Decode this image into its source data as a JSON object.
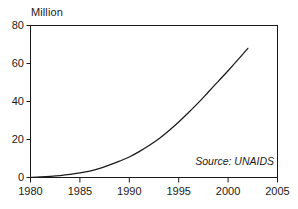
{
  "chart_data": {
    "type": "line",
    "title": "",
    "subtitle": "",
    "unit_label": "Million",
    "xlabel": "",
    "ylabel": "",
    "xlim": [
      1980,
      2005
    ],
    "ylim": [
      0,
      80
    ],
    "grid": false,
    "legend": "none",
    "line_color": "#1a1a1a",
    "background_color": "#ffffff",
    "axis_color": "#1a1a1a",
    "annotations": [
      {
        "name": "source-note",
        "text": "Source: UNAIDS",
        "style": "italic",
        "position": "inside-bottom-right"
      }
    ],
    "xticks": [
      1980,
      1985,
      1990,
      1995,
      2000,
      2005
    ],
    "xtick_labels": [
      "1980",
      "1985",
      "1990",
      "1995",
      "2000",
      "2005"
    ],
    "yticks": [
      0,
      20,
      40,
      60,
      80
    ],
    "ytick_labels": [
      "0",
      "20",
      "40",
      "60",
      "80"
    ],
    "series": [
      {
        "name": "Cumulative infections",
        "x": [
          1980,
          1981,
          1982,
          1983,
          1984,
          1985,
          1986,
          1987,
          1988,
          1989,
          1990,
          1991,
          1992,
          1993,
          1994,
          1995,
          1996,
          1997,
          1998,
          1999,
          2000,
          2001,
          2002
        ],
        "values": [
          0.1,
          0.3,
          0.6,
          1.0,
          1.6,
          2.4,
          3.4,
          4.8,
          6.6,
          8.6,
          10.8,
          13.6,
          16.8,
          20.4,
          24.6,
          29.2,
          34.2,
          39.4,
          45.0,
          50.6,
          56.2,
          62.0,
          68.0
        ]
      }
    ]
  }
}
